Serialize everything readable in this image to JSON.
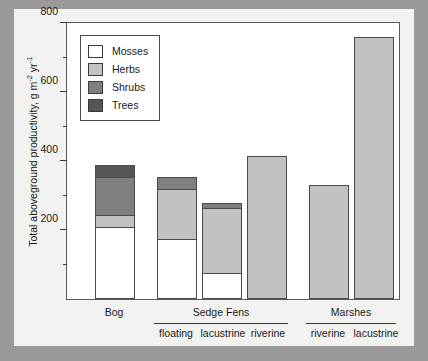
{
  "chart_data": {
    "type": "bar",
    "stacked": true,
    "title": "",
    "xlabel": "",
    "ylabel": "Total aboveground productivity, g m⁻² yr⁻¹",
    "ylim": [
      0,
      800
    ],
    "yticks": [
      0,
      200,
      400,
      600,
      800
    ],
    "ytick_labels": [
      "",
      "200",
      "400",
      "600",
      "800"
    ],
    "yminor_ticks": [
      100,
      300,
      500,
      700
    ],
    "grid": false,
    "legend_position": "upper-left",
    "categories": [
      "Bog",
      "floating",
      "lacustrine",
      "riverine",
      "riverine",
      "lacustrine"
    ],
    "groups": [
      {
        "label": "Bog",
        "members": [
          "Bog"
        ]
      },
      {
        "label": "Sedge Fens",
        "members": [
          "floating",
          "lacustrine",
          "riverine"
        ]
      },
      {
        "label": "Marshes",
        "members": [
          "riverine",
          "lacustrine"
        ]
      }
    ],
    "series": [
      {
        "name": "Mosses",
        "color": "#ffffff",
        "values": [
          210,
          175,
          75,
          0,
          0,
          0
        ]
      },
      {
        "name": "Herbs",
        "color": "#c2c2c2",
        "values": [
          35,
          145,
          190,
          415,
          330,
          760
        ]
      },
      {
        "name": "Shrubs",
        "color": "#7f7f7f",
        "values": [
          110,
          35,
          12,
          0,
          0,
          0
        ]
      },
      {
        "name": "Trees",
        "color": "#565656",
        "values": [
          35,
          0,
          0,
          0,
          0,
          0
        ]
      }
    ],
    "totals": [
      390,
      355,
      277,
      415,
      330,
      760
    ]
  },
  "legend": {
    "items": [
      {
        "label": "Mosses",
        "color": "#ffffff"
      },
      {
        "label": "Herbs",
        "color": "#c2c2c2"
      },
      {
        "label": "Shrubs",
        "color": "#7f7f7f"
      },
      {
        "label": "Trees",
        "color": "#565656"
      }
    ]
  },
  "axis": {
    "y_title_main": "Total aboveground productivity, g m",
    "y_title_sup1": "-2",
    "y_title_mid": " yr",
    "y_title_sup2": "-1",
    "ytick_800": "800",
    "ytick_600": "600",
    "ytick_400": "400",
    "ytick_200": "200"
  },
  "xlabels": {
    "bog": "Bog",
    "sedge_fens": "Sedge Fens",
    "marshes": "Marshes",
    "fen_floating": "floating",
    "fen_lacustrine": "lacustrine",
    "fen_riverine": "riverine",
    "marsh_riverine": "riverine",
    "marsh_lacustrine": "lacustrine"
  },
  "colors": {
    "frame": "#5a5a5a",
    "background": "#9a9a9a",
    "figure": "#f2f2f0",
    "plot": "#ffffff"
  }
}
